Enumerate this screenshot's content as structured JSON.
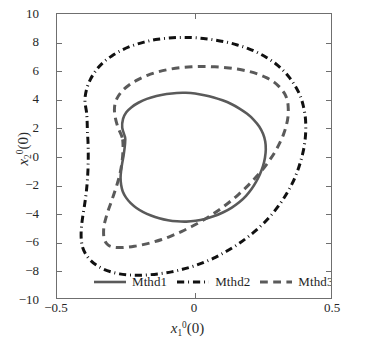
{
  "chart_data": {
    "type": "line",
    "title": "",
    "xlabel": "x_1^0(0)",
    "ylabel": "x_2^0(0)",
    "xlim": [
      -0.5,
      0.5
    ],
    "ylim": [
      -10,
      10
    ],
    "xticks": [
      -0.5,
      0,
      0.5
    ],
    "xticklabels": [
      "-0.5",
      "0",
      "0.5"
    ],
    "yticks": [
      -10,
      -8,
      -6,
      -4,
      -2,
      0,
      2,
      4,
      6,
      8,
      10
    ],
    "yticklabels": [
      "-10",
      "-8",
      "-6",
      "-4",
      "-2",
      "0",
      "2",
      "4",
      "6",
      "8",
      "10"
    ],
    "grid": false,
    "legend_position": "lower center inside",
    "series": [
      {
        "name": "Mthd1",
        "style": "solid",
        "color": "#5a5a5a",
        "width": 2.6,
        "description": "innermost closed limit cycle",
        "x_range": [
          -0.268,
          0.262
        ],
        "y_range": [
          -4.62,
          4.45
        ],
        "points": [
          [
            -0.252,
            1.35
          ],
          [
            -0.262,
            2.0
          ],
          [
            -0.259,
            2.62
          ],
          [
            -0.247,
            3.08
          ],
          [
            -0.228,
            3.44
          ],
          [
            -0.203,
            3.75
          ],
          [
            -0.172,
            4.02
          ],
          [
            -0.137,
            4.22
          ],
          [
            -0.1,
            4.36
          ],
          [
            -0.063,
            4.44
          ],
          [
            -0.03,
            4.45
          ],
          [
            0.004,
            4.4
          ],
          [
            0.038,
            4.28
          ],
          [
            0.072,
            4.12
          ],
          [
            0.104,
            3.92
          ],
          [
            0.136,
            3.66
          ],
          [
            0.166,
            3.34
          ],
          [
            0.194,
            2.97
          ],
          [
            0.218,
            2.55
          ],
          [
            0.238,
            2.08
          ],
          [
            0.252,
            1.56
          ],
          [
            0.26,
            1.02
          ],
          [
            0.262,
            0.46
          ],
          [
            0.259,
            -0.12
          ],
          [
            0.252,
            -0.7
          ],
          [
            0.241,
            -1.26
          ],
          [
            0.227,
            -1.8
          ],
          [
            0.21,
            -2.32
          ],
          [
            0.19,
            -2.8
          ],
          [
            0.166,
            -3.24
          ],
          [
            0.138,
            -3.63
          ],
          [
            0.107,
            -3.96
          ],
          [
            0.074,
            -4.23
          ],
          [
            0.04,
            -4.43
          ],
          [
            0.006,
            -4.56
          ],
          [
            -0.028,
            -4.62
          ],
          [
            -0.062,
            -4.6
          ],
          [
            -0.095,
            -4.52
          ],
          [
            -0.127,
            -4.38
          ],
          [
            -0.157,
            -4.19
          ],
          [
            -0.185,
            -3.95
          ],
          [
            -0.21,
            -3.66
          ],
          [
            -0.231,
            -3.32
          ],
          [
            -0.248,
            -2.93
          ],
          [
            -0.26,
            -2.5
          ],
          [
            -0.266,
            -2.03
          ],
          [
            -0.268,
            -1.53
          ],
          [
            -0.266,
            -1.02
          ],
          [
            -0.262,
            -0.5
          ],
          [
            -0.257,
            0.04
          ],
          [
            -0.253,
            0.6
          ],
          [
            -0.251,
            1.1
          ]
        ]
      },
      {
        "name": "Mthd2",
        "style": "dashdot",
        "color": "#111111",
        "width": 3.0,
        "description": "outermost closed limit cycle",
        "x_range": [
          -0.412,
          0.408
        ],
        "y_range": [
          -8.45,
          8.35
        ],
        "points": [
          [
            -0.392,
            3.05
          ],
          [
            -0.398,
            3.9
          ],
          [
            -0.392,
            4.7
          ],
          [
            -0.378,
            5.4
          ],
          [
            -0.358,
            6.02
          ],
          [
            -0.332,
            6.58
          ],
          [
            -0.3,
            7.05
          ],
          [
            -0.264,
            7.45
          ],
          [
            -0.224,
            7.78
          ],
          [
            -0.182,
            8.02
          ],
          [
            -0.14,
            8.2
          ],
          [
            -0.096,
            8.3
          ],
          [
            -0.052,
            8.35
          ],
          [
            -0.008,
            8.34
          ],
          [
            0.034,
            8.28
          ],
          [
            0.076,
            8.17
          ],
          [
            0.118,
            8.02
          ],
          [
            0.158,
            7.82
          ],
          [
            0.196,
            7.58
          ],
          [
            0.232,
            7.28
          ],
          [
            0.266,
            6.92
          ],
          [
            0.298,
            6.5
          ],
          [
            0.326,
            6.02
          ],
          [
            0.35,
            5.48
          ],
          [
            0.371,
            4.88
          ],
          [
            0.388,
            4.22
          ],
          [
            0.399,
            3.52
          ],
          [
            0.406,
            2.78
          ],
          [
            0.408,
            2.02
          ],
          [
            0.406,
            1.24
          ],
          [
            0.4,
            0.46
          ],
          [
            0.39,
            -0.32
          ],
          [
            0.377,
            -1.1
          ],
          [
            0.36,
            -1.88
          ],
          [
            0.339,
            -2.62
          ],
          [
            0.315,
            -3.34
          ],
          [
            0.288,
            -4.02
          ],
          [
            0.258,
            -4.66
          ],
          [
            0.225,
            -5.26
          ],
          [
            0.19,
            -5.8
          ],
          [
            0.154,
            -6.3
          ],
          [
            0.116,
            -6.74
          ],
          [
            0.078,
            -7.14
          ],
          [
            0.038,
            -7.48
          ],
          [
            -0.002,
            -7.76
          ],
          [
            -0.042,
            -7.98
          ],
          [
            -0.082,
            -8.16
          ],
          [
            -0.122,
            -8.28
          ],
          [
            -0.162,
            -8.36
          ],
          [
            -0.202,
            -8.4
          ],
          [
            -0.238,
            -8.38
          ],
          [
            -0.272,
            -8.3
          ],
          [
            -0.304,
            -8.15
          ],
          [
            -0.333,
            -7.94
          ],
          [
            -0.358,
            -7.66
          ],
          [
            -0.379,
            -7.32
          ],
          [
            -0.395,
            -6.92
          ],
          [
            -0.406,
            -6.46
          ],
          [
            -0.411,
            -5.96
          ],
          [
            -0.412,
            -5.42
          ],
          [
            -0.41,
            -4.86
          ],
          [
            -0.406,
            -4.26
          ],
          [
            -0.401,
            -3.64
          ],
          [
            -0.396,
            -3.0
          ],
          [
            -0.392,
            -2.34
          ],
          [
            -0.389,
            -1.66
          ],
          [
            -0.387,
            -0.98
          ],
          [
            -0.386,
            -0.3
          ],
          [
            -0.386,
            0.38
          ],
          [
            -0.387,
            1.06
          ],
          [
            -0.389,
            1.74
          ],
          [
            -0.39,
            2.42
          ]
        ]
      },
      {
        "name": "Mthd3",
        "style": "dashed",
        "color": "#5a5a5a",
        "width": 3.0,
        "description": "middle closed limit cycle",
        "x_range": [
          -0.33,
          0.344
        ],
        "y_range": [
          -6.45,
          6.3
        ],
        "points": [
          [
            -0.262,
            1.3
          ],
          [
            -0.278,
            2.05
          ],
          [
            -0.288,
            2.78
          ],
          [
            -0.29,
            3.44
          ],
          [
            -0.282,
            4.02
          ],
          [
            -0.264,
            4.54
          ],
          [
            -0.238,
            4.98
          ],
          [
            -0.206,
            5.36
          ],
          [
            -0.17,
            5.68
          ],
          [
            -0.132,
            5.92
          ],
          [
            -0.092,
            6.1
          ],
          [
            -0.05,
            6.22
          ],
          [
            -0.008,
            6.28
          ],
          [
            0.034,
            6.3
          ],
          [
            0.076,
            6.28
          ],
          [
            0.118,
            6.22
          ],
          [
            0.158,
            6.12
          ],
          [
            0.196,
            5.98
          ],
          [
            0.232,
            5.78
          ],
          [
            0.264,
            5.52
          ],
          [
            0.292,
            5.2
          ],
          [
            0.314,
            4.82
          ],
          [
            0.331,
            4.38
          ],
          [
            0.341,
            3.88
          ],
          [
            0.344,
            3.34
          ],
          [
            0.343,
            2.76
          ],
          [
            0.337,
            2.16
          ],
          [
            0.327,
            1.54
          ],
          [
            0.313,
            0.92
          ],
          [
            0.296,
            0.3
          ],
          [
            0.275,
            -0.32
          ],
          [
            0.251,
            -0.94
          ],
          [
            0.224,
            -1.54
          ],
          [
            0.195,
            -2.12
          ],
          [
            0.164,
            -2.68
          ],
          [
            0.131,
            -3.22
          ],
          [
            0.097,
            -3.72
          ],
          [
            0.062,
            -4.18
          ],
          [
            0.026,
            -4.6
          ],
          [
            -0.01,
            -4.98
          ],
          [
            -0.046,
            -5.32
          ],
          [
            -0.082,
            -5.62
          ],
          [
            -0.118,
            -5.88
          ],
          [
            -0.152,
            -6.08
          ],
          [
            -0.186,
            -6.24
          ],
          [
            -0.218,
            -6.36
          ],
          [
            -0.248,
            -6.43
          ],
          [
            -0.276,
            -6.45
          ],
          [
            -0.298,
            -6.4
          ],
          [
            -0.314,
            -6.26
          ],
          [
            -0.324,
            -6.02
          ],
          [
            -0.329,
            -5.7
          ],
          [
            -0.33,
            -5.32
          ],
          [
            -0.328,
            -4.88
          ],
          [
            -0.322,
            -4.4
          ],
          [
            -0.314,
            -3.88
          ],
          [
            -0.304,
            -3.34
          ],
          [
            -0.294,
            -2.78
          ],
          [
            -0.284,
            -2.2
          ],
          [
            -0.275,
            -1.62
          ],
          [
            -0.268,
            -1.04
          ],
          [
            -0.263,
            -0.46
          ],
          [
            -0.26,
            0.12
          ],
          [
            -0.259,
            0.72
          ]
        ]
      }
    ]
  },
  "axes": {
    "x_title_var": "x",
    "x_title_sub": "1",
    "x_title_sup": "0",
    "x_title_arg": "(0)",
    "y_title_var": "x",
    "y_title_sub": "2",
    "y_title_sup": "0",
    "y_title_arg": "(0)"
  },
  "legend": {
    "entries": [
      {
        "label": "Mthd1",
        "style": "solid",
        "color": "#5a5a5a"
      },
      {
        "label": "Mthd2",
        "style": "dashdot",
        "color": "#111111"
      },
      {
        "label": "Mthd3",
        "style": "dashed",
        "color": "#5a5a5a"
      }
    ]
  }
}
